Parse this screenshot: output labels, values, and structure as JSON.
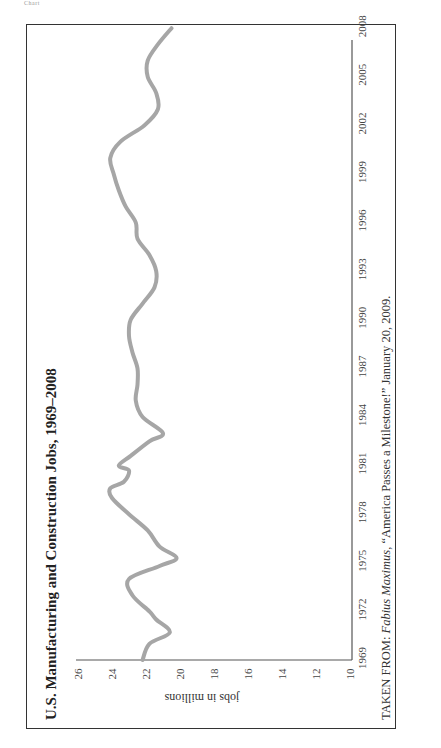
{
  "header_stub": "Chart",
  "chart_data": {
    "type": "line",
    "title": "U.S. Manufacturing and Construction Jobs, 1969–2008",
    "xlabel": "",
    "ylabel": "jobs in millions",
    "orientation": "rotated 90° counterclockwise on page",
    "x_ticks": [
      "1969",
      "1972",
      "1975",
      "1978",
      "1981",
      "1984",
      "1987",
      "1990",
      "1993",
      "1996",
      "1999",
      "2002",
      "2005",
      "2008"
    ],
    "y_ticks": [
      "10",
      "12",
      "14",
      "16",
      "18",
      "20",
      "22",
      "24",
      "26"
    ],
    "xlim": [
      1969,
      2008
    ],
    "ylim": [
      10,
      26
    ],
    "grid": false,
    "legend": null,
    "line_color": "#a6a6a6",
    "series": [
      {
        "name": "Manufacturing and Construction Jobs (millions)",
        "x": [
          1969,
          1970,
          1970.7,
          1971.5,
          1972,
          1973,
          1974,
          1974.8,
          1975.3,
          1976,
          1977,
          1978,
          1979,
          1979.6,
          1980,
          1980.7,
          1981,
          1981.6,
          1982.5,
          1983,
          1984,
          1985,
          1986,
          1987,
          1988,
          1989,
          1990,
          1991,
          1992,
          1993,
          1994,
          1995,
          1996,
          1997,
          1998,
          1999,
          2000,
          2001,
          2002,
          2003,
          2004,
          2005,
          2006,
          2007,
          2008
        ],
        "values": [
          22.2,
          21.8,
          20.6,
          21.4,
          21.8,
          22.8,
          23.0,
          21.2,
          20.2,
          21.2,
          21.9,
          23.0,
          24.0,
          24.1,
          23.3,
          23.0,
          23.6,
          22.9,
          21.8,
          21.0,
          22.2,
          22.6,
          22.5,
          22.5,
          22.8,
          23.0,
          22.9,
          22.2,
          21.5,
          21.4,
          21.8,
          22.5,
          22.6,
          23.2,
          23.6,
          23.9,
          24.1,
          23.5,
          22.1,
          21.3,
          21.4,
          21.9,
          21.9,
          21.3,
          20.5
        ]
      }
    ],
    "source": {
      "prefix": "TAKEN FROM: ",
      "italic": "Fabius Maximus,",
      "suffix": " “America Passes a Milestone!” January 20, 2009."
    }
  }
}
